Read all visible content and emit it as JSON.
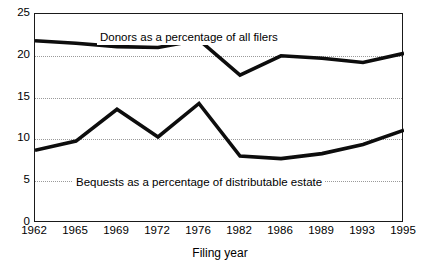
{
  "chart_data": {
    "type": "line",
    "title": "",
    "xlabel": "Filing year",
    "ylabel": "",
    "categories": [
      "1962",
      "1965",
      "1969",
      "1972",
      "1976",
      "1982",
      "1986",
      "1989",
      "1993",
      "1995"
    ],
    "ylim": [
      0,
      25
    ],
    "yticks": [
      "0",
      "5",
      "10",
      "15",
      "20",
      "25"
    ],
    "ytick_values": [
      0,
      5,
      10,
      15,
      20,
      25
    ],
    "gridlines": [
      5,
      10,
      15,
      20
    ],
    "grid": true,
    "legend_position": "inline-annotations",
    "series": [
      {
        "name": "Donors as a percentage of all filers",
        "values": [
          21.8,
          21.5,
          21.1,
          21.0,
          21.9,
          17.7,
          20.0,
          19.7,
          19.2,
          20.3
        ],
        "color": "#0d0d0d"
      },
      {
        "name": "Bequests as a percentage of distributable estate",
        "values": [
          8.7,
          9.8,
          13.6,
          10.3,
          14.3,
          8.0,
          7.7,
          8.3,
          9.4,
          11.1
        ],
        "color": "#0d0d0d"
      }
    ],
    "annotations": [
      {
        "text": "Donors as a percentage of all filers",
        "series": 0
      },
      {
        "text": "Bequests as a percentage of distributable estate",
        "series": 1
      }
    ]
  }
}
